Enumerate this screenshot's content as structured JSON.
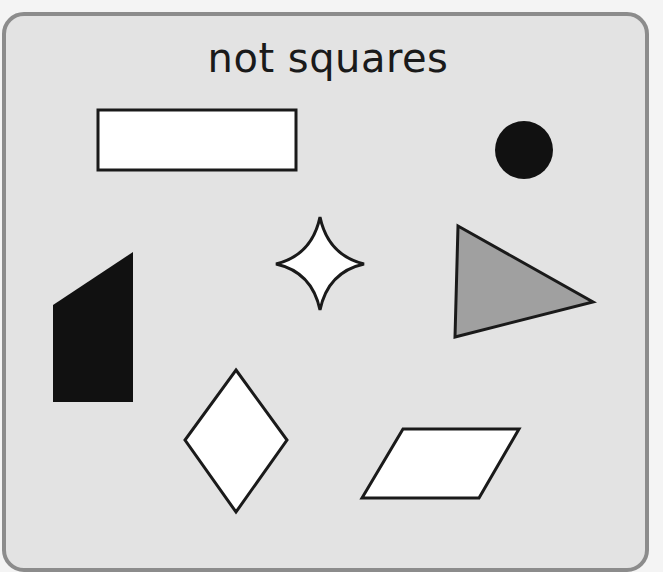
{
  "title": "not squares",
  "colors": {
    "panel_bg": "#e3e3e3",
    "panel_border": "#8c8c8c",
    "outline": "#1a1a1a",
    "white_fill": "#ffffff",
    "black_fill": "#111111",
    "grey_fill": "#a0a0a0"
  },
  "shapes": [
    {
      "name": "rectangle",
      "fill": "white"
    },
    {
      "name": "circle",
      "fill": "black"
    },
    {
      "name": "four-pointed-star",
      "fill": "white"
    },
    {
      "name": "triangle",
      "fill": "grey"
    },
    {
      "name": "trapezium",
      "fill": "black"
    },
    {
      "name": "rhombus",
      "fill": "white"
    },
    {
      "name": "parallelogram",
      "fill": "white"
    }
  ]
}
